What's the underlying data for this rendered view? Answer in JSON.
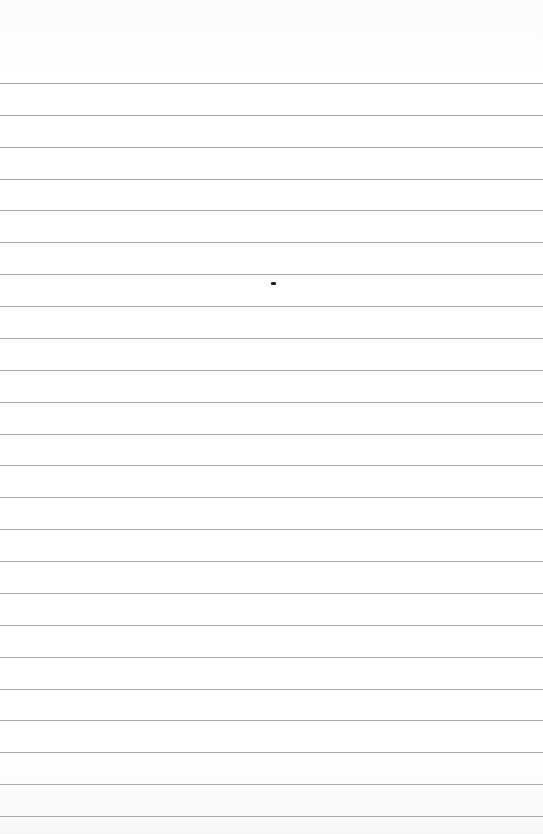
{
  "page": {
    "type": "lined-paper",
    "background": "#ffffff",
    "line_color": "#a9a9a9",
    "first_line_y": 83,
    "line_spacing": 31.87,
    "line_count": 24
  },
  "marks": [
    {
      "type": "dot",
      "x": 271,
      "y": 282,
      "color": "#222222"
    }
  ]
}
